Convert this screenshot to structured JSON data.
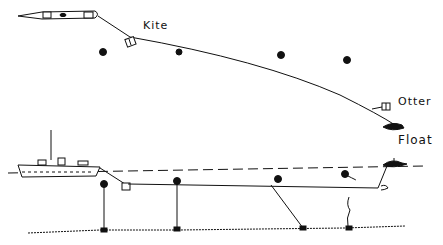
{
  "diagram": {
    "top_view": {
      "labels": {
        "kite": "Kite",
        "otter": "Otter",
        "float": "Float"
      }
    },
    "side_view": {}
  },
  "colors": {
    "ink": "#111111",
    "background": "#ffffff"
  }
}
